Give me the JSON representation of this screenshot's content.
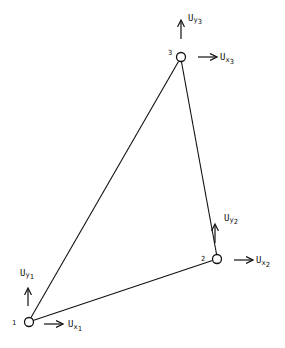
{
  "diagram": {
    "type": "triangular-element",
    "colors": {
      "stroke": "#111111",
      "background": "#ffffff"
    },
    "nodes": [
      {
        "id": "1",
        "x": 29,
        "y": 322,
        "label": "1",
        "ux_label": "U",
        "ux_sub": "x",
        "ux_idx": "1",
        "uy_label": "U",
        "uy_sub": "y",
        "uy_idx": "1"
      },
      {
        "id": "2",
        "x": 217,
        "y": 259,
        "label": "2",
        "ux_label": "U",
        "ux_sub": "x",
        "ux_idx": "2",
        "uy_label": "U",
        "uy_sub": "y",
        "uy_idx": "2"
      },
      {
        "id": "3",
        "x": 181,
        "y": 57,
        "label": "3",
        "ux_label": "U",
        "ux_sub": "x",
        "ux_idx": "3",
        "uy_label": "U",
        "uy_sub": "y",
        "uy_idx": "3"
      }
    ],
    "edges": [
      {
        "from": "1",
        "to": "2"
      },
      {
        "from": "2",
        "to": "3"
      },
      {
        "from": "3",
        "to": "1"
      }
    ]
  }
}
